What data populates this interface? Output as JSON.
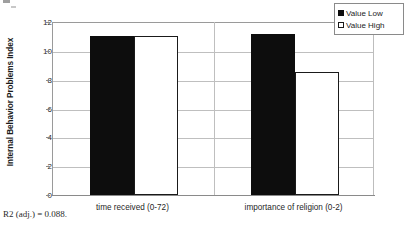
{
  "chart_data": {
    "type": "bar",
    "title": "",
    "xlabel": "",
    "ylabel": "Internal Behavior Problems Index",
    "ylim": [
      0,
      12
    ],
    "yticks": [
      0,
      2,
      4,
      6,
      8,
      10,
      12
    ],
    "ytick_labels": [
      "0",
      "2",
      "4",
      "6",
      "8",
      "10",
      "12"
    ],
    "grid": "horizontal",
    "legend_position": "top-right",
    "categories": [
      "time received (0-72)",
      "importance of religion (0-2)"
    ],
    "series": [
      {
        "name": "Value Low",
        "swatch": "black",
        "values": [
          11.0,
          11.2
        ]
      },
      {
        "name": "Value High",
        "swatch": "white",
        "values": [
          11.0,
          8.5
        ]
      }
    ],
    "annotations": [
      "R2 (adj.) = 0.088."
    ]
  },
  "axis": {
    "y_title": "Internal Behavior Problems Index",
    "ticks": [
      {
        "label": "12",
        "value": 12
      },
      {
        "label": "10",
        "value": 10
      },
      {
        "label": "8",
        "value": 8
      },
      {
        "label": "6",
        "value": 6
      },
      {
        "label": "4",
        "value": 4
      },
      {
        "label": "2",
        "value": 2
      },
      {
        "label": "0",
        "value": 0
      }
    ]
  },
  "categories": [
    {
      "label": "time received (0-72)"
    },
    {
      "label": "importance of religion (0-2)"
    }
  ],
  "legend": {
    "items": [
      {
        "label": "Value Low",
        "color": "#0d0d0d"
      },
      {
        "label": "Value High",
        "color": "#ffffff"
      }
    ]
  },
  "footnote": {
    "text": "R2 (adj.) = 0.088."
  },
  "colors": {
    "series_low": "#0d0d0d",
    "series_high": "#ffffff",
    "gridline": "#bfbfbf",
    "axis": "#8a8a8a",
    "text": "#1c1c1c"
  }
}
